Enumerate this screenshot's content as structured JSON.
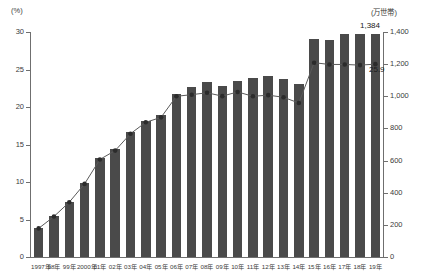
{
  "chart_data": {
    "type": "bar",
    "title": "",
    "subtitle": "",
    "xlabel": "",
    "ylabel": "(%)",
    "ylabel_secondary": "(万世帯)",
    "grid": false,
    "legend_position": "none",
    "ylim": [
      0,
      30
    ],
    "ylim_secondary": [
      0,
      1400
    ],
    "yticks": [
      0,
      5,
      10,
      15,
      20,
      25,
      30
    ],
    "ytick_labels": [
      "0",
      "5",
      "10",
      "15",
      "20",
      "25",
      "30"
    ],
    "yticks_secondary": [
      0,
      200,
      400,
      600,
      800,
      1000,
      1200,
      1400
    ],
    "ytick_labels_secondary": [
      "0",
      "200",
      "400",
      "600",
      "800",
      "1,000",
      "1,200",
      "1,400"
    ],
    "categories": [
      "1997年",
      "98年",
      "99年",
      "2000年",
      "01年",
      "02年",
      "03年",
      "04年",
      "05年",
      "06年",
      "07年",
      "08年",
      "09年",
      "10年",
      "11年",
      "12年",
      "13年",
      "14年",
      "15年",
      "16年",
      "17年",
      "18年",
      "19年"
    ],
    "series": [
      {
        "name": "割合",
        "type": "bar",
        "axis": "left",
        "unit": "%",
        "color": "#4a4a4a",
        "values": [
          3.9,
          5.5,
          7.4,
          9.9,
          13.2,
          14.4,
          16.7,
          18.2,
          18.9,
          21.8,
          22.7,
          23.3,
          22.8,
          23.5,
          23.9,
          24.1,
          23.7,
          23.1,
          29.1,
          28.9,
          29.7,
          29.7,
          29.8
        ]
      },
      {
        "name": "世帯数",
        "type": "line",
        "axis": "right",
        "unit": "万世帯",
        "color": "#2b2b2b",
        "values": [
          178,
          252,
          341,
          455,
          607,
          662,
          767,
          838,
          869,
          1000,
          1010,
          1022,
          1001,
          1027,
          1000,
          1007,
          994,
          958,
          1209,
          1198,
          1198,
          1194,
          1200
        ]
      }
    ],
    "annotations": [
      {
        "text": "1,384",
        "series": "世帯数",
        "category": "19年",
        "position": "above-bar"
      },
      {
        "text": "25.9",
        "series": "世帯数",
        "category": "19年",
        "position": "below-marker"
      }
    ]
  }
}
